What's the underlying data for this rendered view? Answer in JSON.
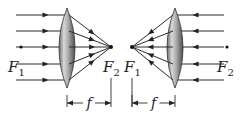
{
  "diagram": {
    "type": "converging-lens-focal-points",
    "panels": [
      {
        "id": "left",
        "light_direction": "left-to-right",
        "lens": {
          "cx": 67,
          "top": 8,
          "bottom": 88,
          "half_width": 8
        },
        "focal_point": {
          "x": 111,
          "y": 47
        },
        "ray_ys": [
          15,
          31,
          47,
          64,
          80
        ],
        "ray_start_x": 16,
        "labels": {
          "near": {
            "text": "F",
            "sub": "1",
            "x": 8,
            "y": 72
          },
          "far": {
            "text": "F",
            "sub": "2",
            "x": 103,
            "y": 72
          }
        },
        "dimension": {
          "x1": 67,
          "x2": 111,
          "y": 103,
          "label": "f"
        }
      },
      {
        "id": "right",
        "light_direction": "right-to-left",
        "lens": {
          "cx": 175,
          "top": 8,
          "bottom": 88,
          "half_width": 8
        },
        "focal_point": {
          "x": 132,
          "y": 47
        },
        "ray_ys": [
          15,
          31,
          47,
          64,
          80
        ],
        "ray_start_x": 224,
        "labels": {
          "near": {
            "text": "F",
            "sub": "1",
            "x": 124,
            "y": 72
          },
          "far": {
            "text": "F",
            "sub": "2",
            "x": 217,
            "y": 72
          }
        },
        "dimension": {
          "x1": 132,
          "x2": 175,
          "y": 103,
          "label": "f"
        }
      }
    ],
    "colors": {
      "stroke": "#2a2a2a",
      "lens_light": "#e6e6e6",
      "lens_mid": "#a8a8a8",
      "lens_dark": "#5c5c5c"
    }
  },
  "text": {
    "left_F1": "F",
    "left_F1_sub": "1",
    "left_F2": "F",
    "left_F2_sub": "2",
    "right_F1": "F",
    "right_F1_sub": "1",
    "right_F2": "F",
    "right_F2_sub": "2",
    "focal_length_left": "f",
    "focal_length_right": "f"
  }
}
